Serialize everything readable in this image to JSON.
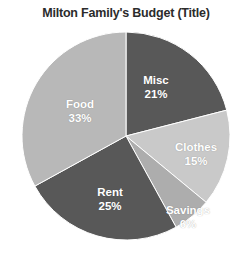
{
  "chart_data": {
    "type": "pie",
    "title": "Milton Family's Budget (Title)",
    "xlabel": "",
    "ylabel": "",
    "legend": "none",
    "grid": false,
    "start_angle_deg": 0,
    "direction": "clockwise",
    "categories": [
      "Misc",
      "Clothes",
      "Savings",
      "Rent",
      "Food"
    ],
    "values": [
      21,
      15,
      6,
      25,
      33
    ],
    "value_unit": "%",
    "labels": [
      "21%",
      "15%",
      "6%",
      "25%",
      "33%"
    ],
    "colors": [
      "#585858",
      "#c9c9c9",
      "#adadad",
      "#585858",
      "#b8b8b8"
    ],
    "slices": [
      {
        "name": "Misc",
        "value": 21,
        "label": "21%",
        "color": "#585858"
      },
      {
        "name": "Clothes",
        "value": 15,
        "label": "15%",
        "color": "#c9c9c9"
      },
      {
        "name": "Savings",
        "value": 6,
        "label": "6%",
        "color": "#adadad"
      },
      {
        "name": "Rent",
        "value": 25,
        "label": "25%",
        "color": "#585858"
      },
      {
        "name": "Food",
        "value": 33,
        "label": "33%",
        "color": "#b8b8b8"
      }
    ]
  },
  "chart": {
    "title": "Milton Family's Budget (Title)",
    "background": "#ffffff",
    "label_color": "#ffffff",
    "title_color": "#2b2b2b"
  }
}
